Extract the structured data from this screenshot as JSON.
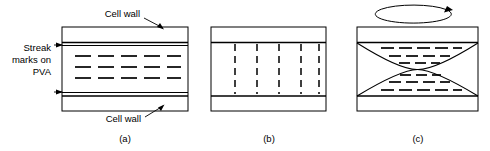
{
  "figure": {
    "background_color": "#ffffff",
    "line_color": "#000000",
    "width": 490,
    "height": 151
  },
  "labels": {
    "cell_wall_top": "Cell wall",
    "cell_wall_bottom": "Cell wall",
    "streak_line1": "Streak",
    "streak_line2": "marks on",
    "streak_line3": "PVA"
  },
  "captions": {
    "a": "(a)",
    "b": "(b)",
    "c": "(c)"
  },
  "panels": {
    "a": {
      "caption": "(a)",
      "x": 62,
      "y": 27,
      "width": 126,
      "height": 84,
      "top_band_y": 42,
      "top_band_inner_y": 45,
      "bottom_band_y": 93,
      "bottom_band_inner_y": 96,
      "streak_orientation": "horizontal",
      "streak_rows": 3,
      "streak_cols": 5,
      "streak_row_y": [
        55,
        66,
        77
      ],
      "streak_dash_length": 16,
      "streak_dash_gap": 7
    },
    "b": {
      "caption": "(b)",
      "x": 211,
      "y": 27,
      "width": 115,
      "height": 84,
      "top_band_y": 42,
      "bottom_band_y": 96,
      "streak_orientation": "vertical",
      "streak_count": 5,
      "streak_x": [
        235,
        257,
        279,
        301,
        319
      ],
      "streak_top_y": 44,
      "streak_bottom_y": 94,
      "streak_dash_length": 7,
      "streak_dash_gap": 5
    },
    "c": {
      "caption": "(c)",
      "x": 357,
      "y": 27,
      "width": 121,
      "height": 84,
      "top_band_y": 42,
      "bottom_band_y": 96,
      "streak_orientation": "horizontal",
      "waist_y": 69,
      "rotation_arrow": true,
      "shape": "hourglass",
      "streak_rows_upper": 3,
      "streak_rows_lower": 3
    }
  },
  "rotation_arrow": {
    "name": "rotation-arrow",
    "center_x": 418,
    "center_y": 14,
    "rx": 38,
    "ry": 8,
    "direction": "clockwise"
  }
}
